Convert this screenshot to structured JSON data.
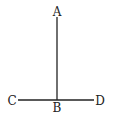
{
  "diagram": {
    "points": [
      {
        "id": "A",
        "label": "A"
      },
      {
        "id": "B",
        "label": "B"
      },
      {
        "id": "C",
        "label": "C"
      },
      {
        "id": "D",
        "label": "D"
      }
    ],
    "segments": [
      {
        "from": "A",
        "to": "B"
      },
      {
        "from": "C",
        "to": "D"
      }
    ],
    "colors": {
      "ink": "#222222",
      "background": "#ffffff"
    }
  }
}
